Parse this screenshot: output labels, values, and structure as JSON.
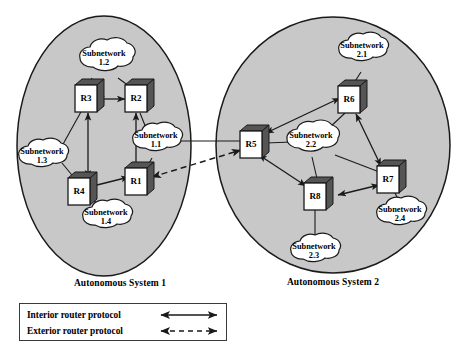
{
  "diagram": {
    "background_color": "#ffffff",
    "as_fill_color": "#c8c8c8",
    "as_stroke_color": "#1a1a1a",
    "cloud_fill_color": "#ffffff",
    "cloud_stroke_color": "#1a1a1a",
    "router_front_color": "#ffffff",
    "router_shade_color": "#555555",
    "line_color": "#1a1a1a"
  },
  "autonomous_systems": [
    {
      "id": "as1",
      "caption": "Autonomous System 1",
      "routers": [
        {
          "id": "r3",
          "label": "R3"
        },
        {
          "id": "r2",
          "label": "R2"
        },
        {
          "id": "r4",
          "label": "R4"
        },
        {
          "id": "r1",
          "label": "R1"
        }
      ],
      "subnetworks": [
        {
          "id": "sub12",
          "name": "Subnetwork",
          "number": "1.2"
        },
        {
          "id": "sub11",
          "name": "Subnetwork",
          "number": "1.1"
        },
        {
          "id": "sub13",
          "name": "Subnetwork",
          "number": "1.3"
        },
        {
          "id": "sub14",
          "name": "Subnetwork",
          "number": "1.4"
        }
      ],
      "interior_links": [
        {
          "from": "R3",
          "to": "R2"
        },
        {
          "from": "R3",
          "to": "R4"
        },
        {
          "from": "R2",
          "to": "R1"
        },
        {
          "from": "R4",
          "to": "R1"
        }
      ],
      "subnetwork_links": [
        {
          "subnetwork": "1.2",
          "routers": [
            "R3",
            "R2"
          ]
        },
        {
          "subnetwork": "1.3",
          "routers": [
            "R3",
            "R4"
          ]
        },
        {
          "subnetwork": "1.1",
          "routers": [
            "R2",
            "R1"
          ]
        },
        {
          "subnetwork": "1.4",
          "routers": [
            "R4"
          ]
        }
      ]
    },
    {
      "id": "as2",
      "caption": "Autonomous System 2",
      "routers": [
        {
          "id": "r5",
          "label": "R5"
        },
        {
          "id": "r6",
          "label": "R6"
        },
        {
          "id": "r7",
          "label": "R7"
        },
        {
          "id": "r8",
          "label": "R8"
        }
      ],
      "subnetworks": [
        {
          "id": "sub21",
          "name": "Subnetwork",
          "number": "2.1"
        },
        {
          "id": "sub22",
          "name": "Subnetwork",
          "number": "2.2"
        },
        {
          "id": "sub23",
          "name": "Subnetwork",
          "number": "2.3"
        },
        {
          "id": "sub24",
          "name": "Subnetwork",
          "number": "2.4"
        }
      ],
      "interior_links": [
        {
          "from": "R5",
          "to": "R6"
        },
        {
          "from": "R6",
          "to": "R7"
        },
        {
          "from": "R7",
          "to": "R8"
        },
        {
          "from": "R5",
          "to": "R8"
        }
      ],
      "subnetwork_links": [
        {
          "subnetwork": "2.1",
          "routers": [
            "R6"
          ]
        },
        {
          "subnetwork": "2.2",
          "routers": [
            "R5",
            "R6",
            "R7",
            "R8"
          ]
        },
        {
          "subnetwork": "2.3",
          "routers": [
            "R8"
          ]
        },
        {
          "subnetwork": "2.4",
          "routers": [
            "R7"
          ]
        }
      ]
    }
  ],
  "exterior_link": {
    "from": "R1",
    "to": "R5",
    "style": "dashed",
    "protocol": "Exterior router protocol"
  },
  "inter_as_subnet_link": {
    "from": "Subnetwork 1.1",
    "to": "R5",
    "style": "solid"
  },
  "legend": {
    "interior": {
      "label": "Interior router protocol",
      "arrow": "solid-double-arrow"
    },
    "exterior": {
      "label": "Exterior router protocol",
      "arrow": "dashed-double-arrow"
    }
  }
}
